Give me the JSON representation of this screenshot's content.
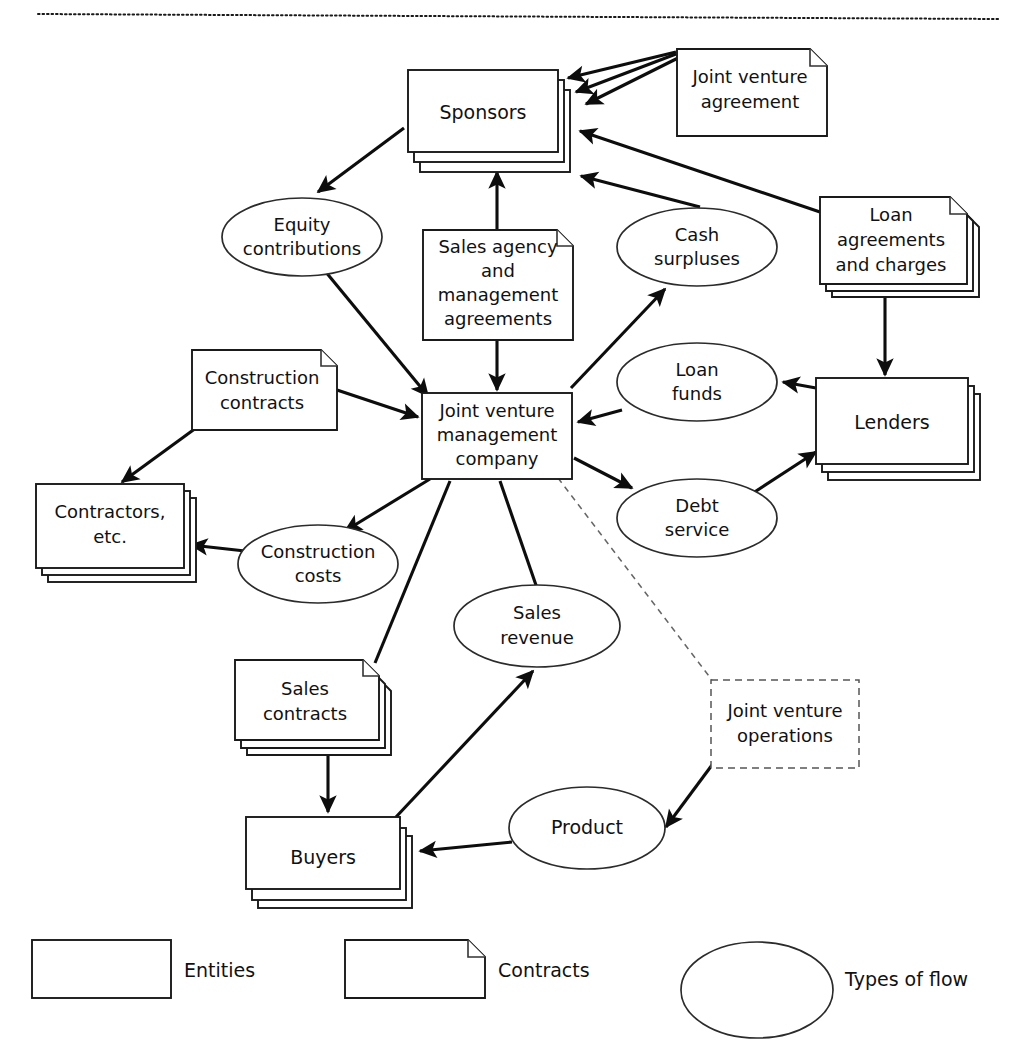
{
  "figure": {
    "top_rule": "dotted-divider"
  },
  "nodes": {
    "sponsors": {
      "label": "Sponsors",
      "shape": "entity-stack",
      "lines": [
        "Sponsors"
      ]
    },
    "joint_venture_agreement": {
      "label": "Joint venture agreement",
      "shape": "contract",
      "lines": [
        "Joint venture",
        "agreement"
      ]
    },
    "loan_agreements_and_charges": {
      "label": "Loan agreements and charges",
      "shape": "contract-stack",
      "lines": [
        "Loan",
        "agreements",
        "and charges"
      ]
    },
    "sales_agency_and_management_agreements": {
      "label": "Sales agency and management agreements",
      "shape": "contract",
      "lines": [
        "Sales agency",
        "and",
        "management",
        "agreements"
      ]
    },
    "equity_contributions": {
      "label": "Equity contributions",
      "shape": "flow",
      "lines": [
        "Equity",
        "contributions"
      ]
    },
    "cash_surpluses": {
      "label": "Cash surpluses",
      "shape": "flow",
      "lines": [
        "Cash",
        "surpluses"
      ]
    },
    "loan_funds": {
      "label": "Loan funds",
      "shape": "flow",
      "lines": [
        "Loan",
        "funds"
      ]
    },
    "debt_service": {
      "label": "Debt service",
      "shape": "flow",
      "lines": [
        "Debt",
        "service"
      ]
    },
    "lenders": {
      "label": "Lenders",
      "shape": "entity-stack",
      "lines": [
        "Lenders"
      ]
    },
    "joint_venture_management_company": {
      "label": "Joint venture management company",
      "shape": "entity",
      "lines": [
        "Joint venture",
        "management",
        "company"
      ]
    },
    "construction_contracts": {
      "label": "Construction contracts",
      "shape": "contract",
      "lines": [
        "Construction",
        "contracts"
      ]
    },
    "contractors_etc": {
      "label": "Contractors, etc.",
      "shape": "entity-stack",
      "lines": [
        "Contractors,",
        "etc."
      ]
    },
    "construction_costs": {
      "label": "Construction costs",
      "shape": "flow",
      "lines": [
        "Construction",
        "costs"
      ]
    },
    "sales_revenue": {
      "label": "Sales revenue",
      "shape": "flow",
      "lines": [
        "Sales",
        "revenue"
      ]
    },
    "sales_contracts": {
      "label": "Sales contracts",
      "shape": "contract-stack",
      "lines": [
        "Sales",
        "contracts"
      ]
    },
    "buyers": {
      "label": "Buyers",
      "shape": "entity-stack",
      "lines": [
        "Buyers"
      ]
    },
    "product": {
      "label": "Product",
      "shape": "flow",
      "lines": [
        "Product"
      ]
    },
    "joint_venture_operations": {
      "label": "Joint venture operations",
      "shape": "boundary-dashed",
      "lines": [
        "Joint venture",
        "operations"
      ]
    }
  },
  "edges": [
    {
      "from": "joint_venture_agreement",
      "to": "sponsors",
      "style": "solid-arrow"
    },
    {
      "from": "joint_venture_agreement",
      "to": "sponsors",
      "style": "solid-arrow"
    },
    {
      "from": "joint_venture_agreement",
      "to": "sponsors",
      "style": "solid-arrow"
    },
    {
      "from": "sponsors",
      "to": "equity_contributions",
      "style": "solid-arrow"
    },
    {
      "from": "equity_contributions",
      "to": "joint_venture_management_company",
      "style": "solid-arrow"
    },
    {
      "from": "sales_agency_and_management_agreements",
      "to": "sponsors",
      "style": "solid-arrow"
    },
    {
      "from": "sales_agency_and_management_agreements",
      "to": "joint_venture_management_company",
      "style": "solid-arrow"
    },
    {
      "from": "loan_agreements_and_charges",
      "to": "sponsors",
      "style": "solid-arrow"
    },
    {
      "from": "cash_surpluses",
      "to": "sponsors",
      "style": "solid-arrow"
    },
    {
      "from": "joint_venture_management_company",
      "to": "cash_surpluses",
      "style": "solid-arrow"
    },
    {
      "from": "loan_agreements_and_charges",
      "to": "lenders",
      "style": "solid-arrow"
    },
    {
      "from": "lenders",
      "to": "loan_funds",
      "style": "solid-arrow"
    },
    {
      "from": "loan_funds",
      "to": "joint_venture_management_company",
      "style": "solid-arrow"
    },
    {
      "from": "joint_venture_management_company",
      "to": "debt_service",
      "style": "solid-arrow"
    },
    {
      "from": "debt_service",
      "to": "lenders",
      "style": "solid-arrow"
    },
    {
      "from": "construction_contracts",
      "to": "joint_venture_management_company",
      "style": "solid-arrow"
    },
    {
      "from": "construction_contracts",
      "to": "contractors_etc",
      "style": "solid-arrow"
    },
    {
      "from": "joint_venture_management_company",
      "to": "construction_costs",
      "style": "solid-arrow"
    },
    {
      "from": "construction_costs",
      "to": "contractors_etc",
      "style": "solid-arrow"
    },
    {
      "from": "sales_contracts",
      "to": "joint_venture_management_company",
      "style": "solid-line"
    },
    {
      "from": "sales_contracts",
      "to": "buyers",
      "style": "solid-arrow"
    },
    {
      "from": "buyers",
      "to": "sales_revenue",
      "style": "solid-arrow"
    },
    {
      "from": "sales_revenue",
      "to": "joint_venture_management_company",
      "style": "solid-line"
    },
    {
      "from": "product",
      "to": "buyers",
      "style": "solid-arrow"
    },
    {
      "from": "joint_venture_operations",
      "to": "product",
      "style": "solid-arrow"
    },
    {
      "from": "joint_venture_management_company",
      "to": "joint_venture_operations",
      "style": "dashed-line"
    }
  ],
  "legend": {
    "items": [
      {
        "key": "entities",
        "label": "Entities",
        "shape": "rectangle"
      },
      {
        "key": "contracts",
        "label": "Contracts",
        "shape": "folded-page"
      },
      {
        "key": "types_of_flow",
        "label": "Types of flow",
        "shape": "ellipse"
      }
    ]
  }
}
